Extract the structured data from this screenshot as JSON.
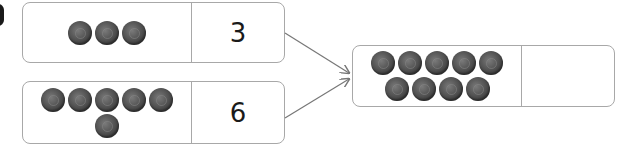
{
  "diagram": {
    "type": "number-bond-addition",
    "inputs": [
      {
        "bead_rows": [
          3
        ],
        "bead_count": 3,
        "number": "3"
      },
      {
        "bead_rows": [
          5,
          1
        ],
        "bead_count": 6,
        "number": "6"
      }
    ],
    "result": {
      "bead_rows": [
        5,
        4
      ],
      "bead_count": 9,
      "number": ""
    },
    "colors": {
      "bead": "#555555",
      "border": "#a8a8a8",
      "arrow": "#777777",
      "text": "#1a1a1a"
    }
  }
}
